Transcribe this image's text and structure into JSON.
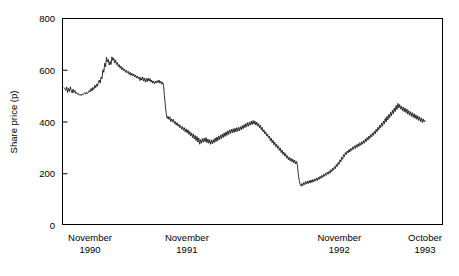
{
  "chart_data": {
    "type": "line",
    "title": "",
    "subtitle": "",
    "xlabel": "",
    "ylabel": "Share price (p)",
    "ylim": [
      0,
      800
    ],
    "yticks": [
      0,
      200,
      400,
      600,
      800
    ],
    "ytick_labels": [
      "0",
      "200",
      "400",
      "600",
      "800"
    ],
    "grid": false,
    "legend": null,
    "legend_position": "none",
    "xtick_labels": [
      {
        "month": "November",
        "year": "1990"
      },
      {
        "month": "November",
        "year": "1991"
      },
      {
        "month": "November",
        "year": "1992"
      },
      {
        "month": "October",
        "year": "1993"
      }
    ],
    "xtick_positions": [
      0,
      0.3278,
      0.7278,
      1.0
    ],
    "x_range_description": "November 1990 to October 1993",
    "line_color": "#1a1a1a",
    "axis_color": "#000000",
    "background_color": "#ffffff",
    "series": [
      {
        "name": "Share price",
        "units": "p",
        "values": [
          530,
          528,
          520,
          534,
          512,
          528,
          516,
          534,
          520,
          510,
          525,
          512,
          520,
          508,
          512,
          505,
          508,
          502,
          505,
          500,
          506,
          503,
          508,
          512,
          506,
          512,
          508,
          514,
          520,
          514,
          528,
          518,
          532,
          524,
          540,
          530,
          545,
          536,
          552,
          560,
          548,
          572,
          566,
          600,
          590,
          625,
          612,
          648,
          630,
          640,
          618,
          632,
          620,
          650,
          636,
          645,
          626,
          638,
          620,
          628,
          612,
          620,
          606,
          614,
          600,
          608,
          596,
          602,
          590,
          598,
          588,
          594,
          582,
          590,
          578,
          586,
          576,
          584,
          572,
          580,
          568,
          576,
          566,
          572,
          558,
          570,
          560,
          572,
          556,
          568,
          552,
          566,
          554,
          568,
          556,
          566,
          552,
          560,
          548,
          556,
          546,
          556,
          548,
          558,
          550,
          560,
          548,
          556,
          544,
          552,
          540,
          500,
          462,
          430,
          412,
          420,
          408,
          418,
          400,
          410,
          398,
          408,
          392,
          400,
          386,
          396,
          382,
          390,
          376,
          384,
          370,
          380,
          366,
          376,
          360,
          372,
          356,
          368,
          350,
          362,
          344,
          356,
          338,
          352,
          332,
          346,
          326,
          342,
          320,
          336,
          312,
          330,
          316,
          334,
          320,
          336,
          322,
          338,
          318,
          332,
          316,
          330,
          312,
          328,
          314,
          330,
          318,
          336,
          322,
          340,
          326,
          344,
          330,
          348,
          334,
          352,
          338,
          356,
          342,
          360,
          346,
          364,
          350,
          368,
          354,
          370,
          356,
          372,
          358,
          374,
          360,
          376,
          362,
          378,
          364,
          380,
          368,
          384,
          372,
          388,
          376,
          392,
          380,
          396,
          382,
          398,
          386,
          402,
          388,
          404,
          390,
          402,
          386,
          398,
          382,
          392,
          376,
          386,
          368,
          378,
          360,
          368,
          352,
          360,
          344,
          352,
          336,
          344,
          326,
          336,
          318,
          328,
          310,
          320,
          302,
          312,
          296,
          306,
          288,
          298,
          280,
          290,
          272,
          282,
          266,
          276,
          258,
          268,
          252,
          262,
          248,
          258,
          244,
          254,
          240,
          250,
          236,
          246,
          230,
          196,
          172,
          158,
          150,
          160,
          152,
          164,
          156,
          168,
          158,
          170,
          160,
          172,
          162,
          174,
          164,
          176,
          166,
          178,
          170,
          182,
          172,
          184,
          176,
          188,
          180,
          192,
          184,
          196,
          188,
          200,
          192,
          204,
          196,
          208,
          200,
          214,
          206,
          220,
          212,
          226,
          218,
          234,
          226,
          242,
          234,
          252,
          244,
          262,
          254,
          272,
          264,
          280,
          272,
          286,
          278,
          292,
          282,
          296,
          288,
          302,
          292,
          306,
          296,
          310,
          300,
          314,
          304,
          318,
          308,
          322,
          312,
          326,
          316,
          332,
          322,
          338,
          328,
          344,
          334,
          350,
          340,
          356,
          346,
          362,
          352,
          370,
          360,
          378,
          368,
          386,
          376,
          394,
          382,
          402,
          390,
          412,
          398,
          420,
          406,
          428,
          414,
          436,
          422,
          444,
          430,
          452,
          438,
          462,
          446,
          470,
          452,
          466,
          448,
          460,
          442,
          456,
          438,
          452,
          434,
          448,
          428,
          442,
          424,
          438,
          420,
          434,
          416,
          430,
          412,
          426,
          408,
          422,
          404,
          418,
          400,
          414,
          396,
          410,
          398,
          404
        ]
      }
    ]
  },
  "plot_geometry": {
    "left": 62,
    "top": 18,
    "right": 443,
    "bottom": 225
  }
}
